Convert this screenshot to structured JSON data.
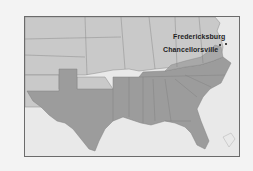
{
  "map": {
    "region": "Southeastern United States",
    "colors": {
      "background": "#f3f3f3",
      "water": "#e9e9e9",
      "union_states": "#c9c9c9",
      "confederate_states": "#9c9c9c",
      "border": "#6b6b6b",
      "state_lines": "#8a8a8a",
      "text": "#1e1e1e"
    },
    "markers": [
      {
        "name": "Fredericksburg",
        "label": "Fredericksburg"
      },
      {
        "name": "Chancellorsville",
        "label": "Chancellorsville"
      }
    ]
  }
}
